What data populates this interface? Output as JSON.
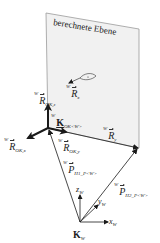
{
  "diagram": {
    "plane_label": "berechnete Ebene",
    "colors": {
      "plane_fill": "#f1f1f1",
      "plane_edge": "#9a9a9a",
      "line": "#1a1a1a",
      "text": "#222222"
    },
    "frames": [
      {
        "id": "object-frame",
        "name": "K",
        "subscript": "OK<W>",
        "axes": [
          {
            "id": "x",
            "label_sup": "W",
            "label": "R",
            "label_sub": "OK,x"
          },
          {
            "id": "y",
            "label_sup": "W",
            "label": "R",
            "label_sub": "OK,y"
          },
          {
            "id": "z",
            "label_sup": "W",
            "label": "R",
            "label_sub": "OK,z"
          }
        ]
      },
      {
        "id": "world-frame",
        "name": "K",
        "subscript": "W",
        "axes": [
          {
            "id": "x",
            "label": "x",
            "label_sub": "W"
          },
          {
            "id": "y",
            "label": "y",
            "label_sub": "W"
          },
          {
            "id": "z",
            "label": "z",
            "label_sub": "W"
          }
        ]
      }
    ],
    "vectors": [
      {
        "id": "Rx",
        "label_sup": "W",
        "label": "R",
        "label_sub": "x"
      },
      {
        "id": "Ry",
        "label_sup": "W",
        "label": "R",
        "label_sub": "y"
      },
      {
        "id": "P1",
        "label_sup": "W",
        "label": "P",
        "label_sub": "H1_P<W>"
      },
      {
        "id": "P2",
        "label_sup": "W",
        "label": "P",
        "label_sub": "H2_P<W>"
      }
    ]
  }
}
